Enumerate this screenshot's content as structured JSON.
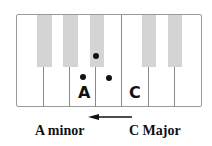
{
  "diagram": {
    "keyboard": {
      "white_keys": 7,
      "black_key_color": "#d4d4d4",
      "border_color": "#8a8a8a"
    },
    "key_labels": [
      {
        "text": "A"
      },
      {
        "text": "C"
      }
    ],
    "dots": 3,
    "arrow": {
      "direction": "left"
    },
    "captions": {
      "left": "A minor",
      "right": "C Major"
    }
  }
}
